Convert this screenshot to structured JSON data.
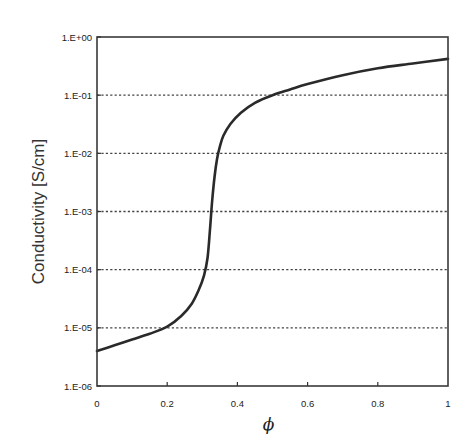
{
  "chart_data": {
    "type": "line",
    "title": "",
    "xlabel": "ϕ",
    "ylabel": "Conductivity  [S/cm]",
    "xlim": [
      0,
      1
    ],
    "ylim": [
      1e-06,
      1
    ],
    "yscale": "log",
    "grid": "horizontal dotted at each decade",
    "x_ticks": [
      "0",
      "0.2",
      "0.4",
      "0.6",
      "0.8",
      "1"
    ],
    "x_tick_values": [
      0,
      0.2,
      0.4,
      0.6,
      0.8,
      1
    ],
    "y_ticks": [
      "1.E+00",
      "1.E-01",
      "1.E-02",
      "1.E-03",
      "1.E-04",
      "1.E-05",
      "1.E-06"
    ],
    "y_tick_values": [
      1,
      0.1,
      0.01,
      0.001,
      0.0001,
      1e-05,
      1e-06
    ],
    "series": [
      {
        "name": "conductivity",
        "color": "#2a2a2a",
        "x": [
          0,
          0.05,
          0.1,
          0.15,
          0.2,
          0.24,
          0.27,
          0.29,
          0.305,
          0.315,
          0.322,
          0.328,
          0.335,
          0.342,
          0.35,
          0.36,
          0.38,
          0.41,
          0.45,
          0.5,
          0.55,
          0.6,
          0.7,
          0.8,
          0.9,
          1.0
        ],
        "y": [
          4e-06,
          5e-06,
          6.3e-06,
          7.9e-06,
          1.05e-05,
          1.6e-05,
          2.6e-05,
          4.5e-05,
          8e-05,
          0.00016,
          0.0005,
          0.0015,
          0.004,
          0.008,
          0.013,
          0.02,
          0.032,
          0.05,
          0.074,
          0.1,
          0.125,
          0.155,
          0.22,
          0.29,
          0.35,
          0.42
        ]
      }
    ]
  }
}
